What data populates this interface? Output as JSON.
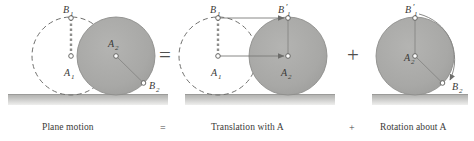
{
  "figure": {
    "background": "#ffffff",
    "disk_fill": "#a9a9a7",
    "disk_stroke": "#8a8a88",
    "dashed_stroke": "#6f6f6d",
    "ground_color": "#b9b9b7",
    "ground_edge": "#9a9a98",
    "label_color": "#3a3a38",
    "line_color": "#7a7a78"
  },
  "panels": [
    {
      "id": "plane-motion",
      "caption": "Plane motion",
      "labels": {
        "b1": "B",
        "b1_sub": "1",
        "a1": "A",
        "a1_sub": "1",
        "a2": "A",
        "a2_sub": "2",
        "b2": "B",
        "b2_sub": "2"
      }
    },
    {
      "id": "translation",
      "caption": "Translation with A",
      "labels": {
        "b1": "B",
        "b1_sub": "1",
        "b1p": "B",
        "b1p_sub": "1",
        "b1p_prime": "′",
        "a1": "A",
        "a1_sub": "1",
        "a2": "A",
        "a2_sub": "2"
      }
    },
    {
      "id": "rotation",
      "caption": "Rotation about A",
      "labels": {
        "b1p": "B",
        "b1p_sub": "1",
        "b1p_prime": "′",
        "a": "A",
        "a_sub": "2",
        "b2": "B",
        "b2_sub": "2"
      }
    }
  ],
  "operators": {
    "equals_big": "=",
    "plus_big": "+",
    "equals_caption": "=",
    "plus_caption": "+"
  }
}
